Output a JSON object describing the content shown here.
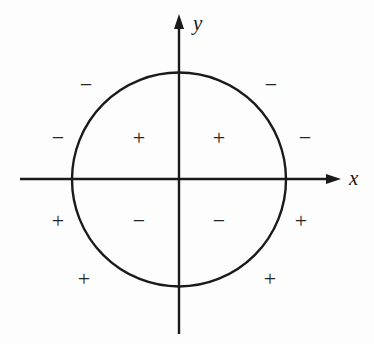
{
  "diagram": {
    "type": "sign-chart",
    "colors": {
      "stroke": "#1a1a1a",
      "background": "#fdfdfd"
    },
    "axes": {
      "x_label": "x",
      "y_label": "y"
    },
    "circle": {
      "center": [
        179,
        179.5
      ],
      "radius": 107
    },
    "signs": [
      {
        "symbol": "−",
        "x": 86,
        "y": 85,
        "region": "outside-top-left"
      },
      {
        "symbol": "−",
        "x": 271,
        "y": 85,
        "region": "outside-top-right"
      },
      {
        "symbol": "−",
        "x": 58,
        "y": 138,
        "region": "outside-left-upper"
      },
      {
        "symbol": "+",
        "x": 139,
        "y": 138,
        "region": "inside-upper-left"
      },
      {
        "symbol": "+",
        "x": 219,
        "y": 138,
        "region": "inside-upper-right"
      },
      {
        "symbol": "−",
        "x": 305,
        "y": 138,
        "region": "outside-right-upper"
      },
      {
        "symbol": "+",
        "x": 58,
        "y": 221,
        "region": "outside-left-lower"
      },
      {
        "symbol": "−",
        "x": 139,
        "y": 221,
        "region": "inside-lower-left"
      },
      {
        "symbol": "−",
        "x": 219,
        "y": 221,
        "region": "inside-lower-right"
      },
      {
        "symbol": "+",
        "x": 301,
        "y": 221,
        "region": "outside-right-lower"
      },
      {
        "symbol": "+",
        "x": 84,
        "y": 279,
        "region": "outside-bottom-left"
      },
      {
        "symbol": "+",
        "x": 270,
        "y": 279,
        "region": "outside-bottom-right"
      }
    ]
  }
}
